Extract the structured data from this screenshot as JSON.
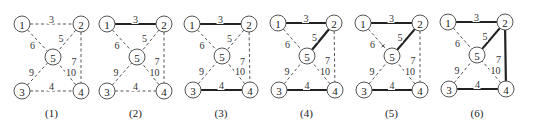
{
  "figure": {
    "node_radius": 8,
    "weights": {
      "1-2": "3",
      "1-5": "6",
      "2-5": "5",
      "2-4": "7",
      "3-5": "9",
      "4-5": "10",
      "3-4": "4"
    },
    "panels": [
      {
        "caption": "(1)",
        "nodes": {
          "1": [
            22,
            24
          ],
          "2": [
            81,
            24
          ],
          "3": [
            22,
            91
          ],
          "4": [
            81,
            91
          ],
          "5": [
            53,
            57
          ]
        },
        "solid_edges": []
      },
      {
        "caption": "(2)",
        "nodes": {
          "1": [
            107,
            24
          ],
          "2": [
            164,
            24
          ],
          "3": [
            107,
            91
          ],
          "4": [
            164,
            91
          ],
          "5": [
            137,
            57
          ]
        },
        "solid_edges": [
          "1-2"
        ]
      },
      {
        "caption": "(3)",
        "nodes": {
          "1": [
            192,
            24
          ],
          "2": [
            249,
            24
          ],
          "3": [
            193,
            90
          ],
          "4": [
            250,
            90
          ],
          "5": [
            222,
            56
          ]
        },
        "solid_edges": [
          "1-2",
          "3-4"
        ]
      },
      {
        "caption": "(4)",
        "nodes": {
          "1": [
            278,
            23
          ],
          "2": [
            334,
            23
          ],
          "3": [
            279,
            90
          ],
          "4": [
            335,
            90
          ],
          "5": [
            307,
            56
          ]
        },
        "solid_edges": [
          "1-2",
          "3-4",
          "2-5"
        ]
      },
      {
        "caption": "(5)",
        "nodes": {
          "1": [
            363,
            23
          ],
          "2": [
            420,
            23
          ],
          "3": [
            364,
            90
          ],
          "4": [
            420,
            90
          ],
          "5": [
            392,
            56
          ]
        },
        "solid_edges": [
          "1-2",
          "3-4",
          "2-5"
        ],
        "marked_edges": [
          "1-5"
        ]
      },
      {
        "caption": "(6)",
        "nodes": {
          "1": [
            448,
            22
          ],
          "2": [
            505,
            22
          ],
          "3": [
            449,
            89
          ],
          "4": [
            506,
            89
          ],
          "5": [
            477,
            55
          ]
        },
        "solid_edges": [
          "1-2",
          "3-4",
          "2-5",
          "2-4"
        ]
      }
    ],
    "caption_y": 113
  }
}
